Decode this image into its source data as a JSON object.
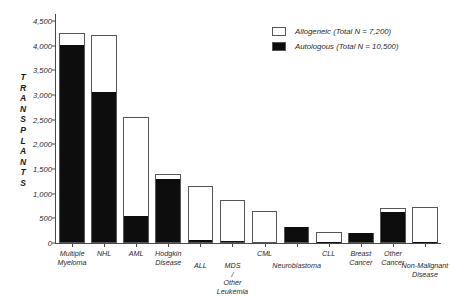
{
  "chart_data": {
    "type": "bar",
    "stacked": true,
    "title": "",
    "xlabel": "",
    "ylabel": "TRANSPLANTS",
    "ylim": [
      0,
      4500
    ],
    "ytick_labels": [
      "0",
      "500",
      "1,000",
      "1,500",
      "2,000",
      "2,500",
      "3,000",
      "3,500",
      "4,000",
      "4,500"
    ],
    "ytick_values": [
      0,
      500,
      1000,
      1500,
      2000,
      2500,
      3000,
      3500,
      4000,
      4500
    ],
    "grid": false,
    "legend_position": "top-right",
    "categories": [
      "Multiple Myeloma",
      "NHL",
      "AML",
      "Hodgkin Disease",
      "ALL",
      "MDS / Other Leukemia",
      "CML",
      "Neuroblastoma",
      "CLL",
      "Breast Cancer",
      "Other Cancer",
      "Non-Malignant Disease"
    ],
    "series": [
      {
        "name": "Autologous",
        "color": "#0d0d0d",
        "values": [
          4020,
          3060,
          540,
          1300,
          60,
          40,
          0,
          330,
          30,
          200,
          620,
          30
        ]
      },
      {
        "name": "Allogeneic",
        "color": "#ffffff",
        "values": [
          230,
          1160,
          2010,
          100,
          1090,
          840,
          650,
          0,
          200,
          0,
          80,
          700
        ]
      }
    ],
    "totals": [
      4250,
      4220,
      2550,
      1400,
      1150,
      880,
      650,
      330,
      230,
      200,
      700,
      730
    ]
  },
  "axis": {
    "y_title_letters": [
      "T",
      "R",
      "A",
      "N",
      "S",
      "P",
      "L",
      "A",
      "N",
      "T",
      "S"
    ]
  },
  "legend": {
    "items": [
      {
        "label": "Allogeneic (Total N = 7,200)",
        "swatch": "allo"
      },
      {
        "label": "Autologous (Total N = 10,500)",
        "swatch": "auto"
      }
    ]
  }
}
